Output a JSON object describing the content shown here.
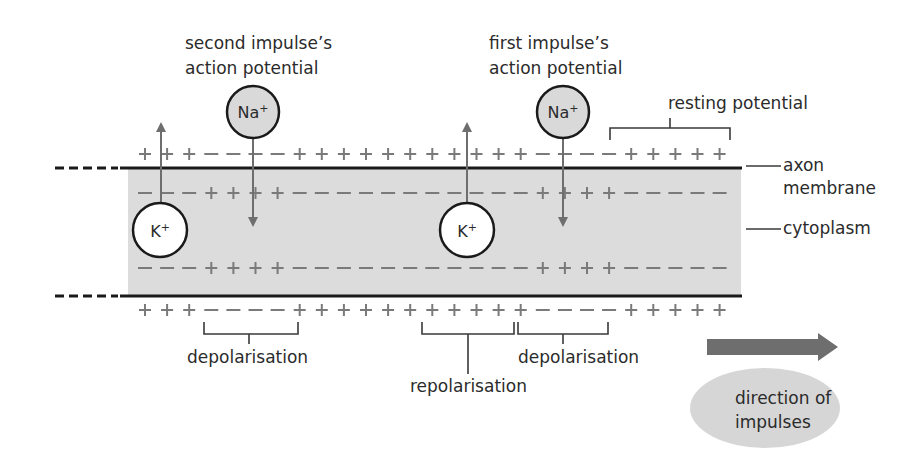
{
  "diagram": {
    "title_labels": {
      "second_impulse": [
        "second impulse’s",
        "action potential"
      ],
      "first_impulse": [
        "first impulse’s",
        "action potential"
      ],
      "resting_potential": "resting potential"
    },
    "side_labels": {
      "axon_membrane": [
        "axon",
        "membrane"
      ],
      "cytoplasm": "cytoplasm"
    },
    "bottom_labels": {
      "depolarisation_left": "depolarisation",
      "repolarisation": "repolarisation",
      "depolarisation_right": "depolarisation"
    },
    "ions": [
      {
        "id": "na-second",
        "symbol": "Na",
        "charge": "+",
        "fill": "#d9d9d9",
        "direction": "into axon"
      },
      {
        "id": "k-second",
        "symbol": "K",
        "charge": "+",
        "fill": "#ffffff",
        "direction": "out of axon"
      },
      {
        "id": "na-first",
        "symbol": "Na",
        "charge": "+",
        "fill": "#d9d9d9",
        "direction": "into axon"
      },
      {
        "id": "k-first",
        "symbol": "K",
        "charge": "+",
        "fill": "#ffffff",
        "direction": "out of axon"
      }
    ],
    "charge_rows": {
      "outer_top": "+++−−−−+++++++++++−−−−+++++",
      "inner_top": "−−−++++−−−−−−−−−−−++++−−−−−",
      "inner_bottom": "−−−++++−−−−−−−−−−−++++−−−−−",
      "outer_bottom": "+++−−−−+++++++++++−−−−+++++"
    },
    "direction": {
      "label": [
        "direction of",
        "impulses"
      ],
      "arrow_color": "#6e6e6e",
      "ellipse_color": "#d6d6d6"
    },
    "colors": {
      "cytoplasm": "#dcdcdc",
      "membrane": "#1a1a1a",
      "charge": "#7a7a7a",
      "arrow": "#6e6e6e"
    }
  }
}
